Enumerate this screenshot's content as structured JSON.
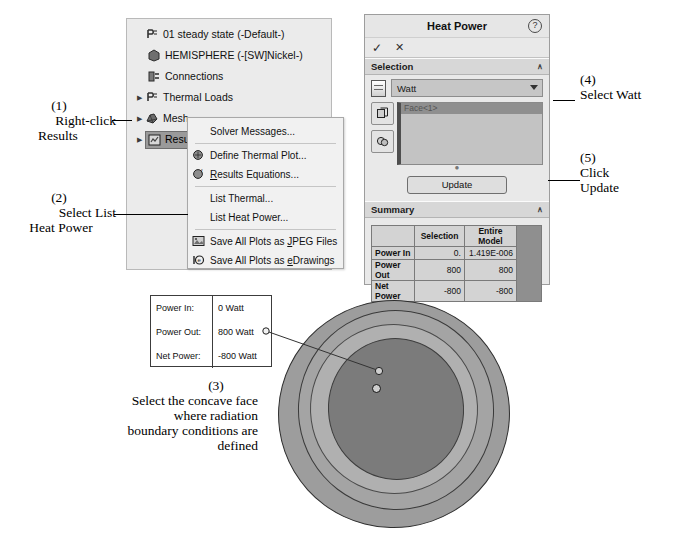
{
  "tree": {
    "items": [
      {
        "label": "01 steady state (-Default-)",
        "icon": "study-icon",
        "twisty": false,
        "indent": 0,
        "selected": false
      },
      {
        "label": "HEMISPHERE (-[SW]Nickel-)",
        "icon": "solid-body-icon",
        "twisty": false,
        "indent": 1,
        "selected": false
      },
      {
        "label": "Connections",
        "icon": "connections-icon",
        "twisty": false,
        "indent": 1,
        "selected": false
      },
      {
        "label": "Thermal Loads",
        "icon": "thermal-loads-icon",
        "twisty": true,
        "indent": 0,
        "selected": false
      },
      {
        "label": "Mesh",
        "icon": "mesh-icon",
        "twisty": true,
        "indent": 0,
        "selected": false
      },
      {
        "label": "Results",
        "icon": "results-icon",
        "twisty": true,
        "indent": 0,
        "selected": true
      }
    ]
  },
  "context_menu": {
    "groups": [
      [
        {
          "label": "Solver Messages...",
          "icon": "",
          "underline": ""
        }
      ],
      [
        {
          "label": "Define Thermal Plot...",
          "icon": "thermal-plot-icon",
          "underline": ""
        },
        {
          "label": "Results Equations...",
          "icon": "results-equations-icon",
          "underline": "R"
        }
      ],
      [
        {
          "label": "List Thermal...",
          "icon": "",
          "underline": ""
        },
        {
          "label": "List Heat Power...",
          "icon": "",
          "underline": ""
        }
      ],
      [
        {
          "label": "Save All Plots as JPEG Files",
          "icon": "jpeg-icon",
          "underline": "J"
        },
        {
          "label": "Save All Plots as eDrawings",
          "icon": "edrawings-icon",
          "underline": "e"
        }
      ]
    ]
  },
  "heat_power": {
    "title": "Heat Power",
    "help_glyph": "?",
    "ok_glyph": "✓",
    "cancel_glyph": "✕",
    "selection": {
      "header": "Selection",
      "collapse_glyph": "∧",
      "units_value": "Watt",
      "units_options": [
        "Watt",
        "BTU/s",
        "kW",
        "cal/s"
      ],
      "list_items": [
        "Face<1>"
      ],
      "tool_faces_glyph": "❐",
      "tool_bodies_glyph": "◑"
    },
    "update_label": "Update",
    "summary": {
      "header": "Summary",
      "collapse_glyph": "∧",
      "columns": [
        "",
        "Selection",
        "Entire Model"
      ],
      "rows": [
        {
          "label": "Power In",
          "selection": "0.",
          "entire_model": "1.419E-006"
        },
        {
          "label": "Power Out",
          "selection": "800",
          "entire_model": "800"
        },
        {
          "label": "Net Power",
          "selection": "-800",
          "entire_model": "-800"
        }
      ]
    }
  },
  "result_box": {
    "rows": [
      {
        "key": "Power In:",
        "value": "0 Watt"
      },
      {
        "key": "Power Out:",
        "value": "800 Watt"
      },
      {
        "key": "Net Power:",
        "value": "-800 Watt"
      }
    ]
  },
  "annotations": {
    "step1": {
      "number": "(1)",
      "line1": "Right-click",
      "line2": "Results"
    },
    "step2": {
      "number": "(2)",
      "line1": "Select List",
      "line2": "Heat Power"
    },
    "step3": {
      "number": "(3)",
      "line1": "Select the concave face",
      "line2": "where radiation",
      "line3": "boundary conditions are",
      "line4": "defined"
    },
    "step4": {
      "number": "(4)",
      "line1": "Select Watt"
    },
    "step5": {
      "number": "(5)",
      "line1": "Click",
      "line2": "Update"
    }
  },
  "colors": {
    "panel_bg": "#e9e9e9",
    "tree_bg": "#ebebeb",
    "menu_bg": "#f1f1f1",
    "selection_highlight": "#9a9a9a",
    "model_outer": "#9d9d9d",
    "model_face": "#7b7b7b"
  }
}
